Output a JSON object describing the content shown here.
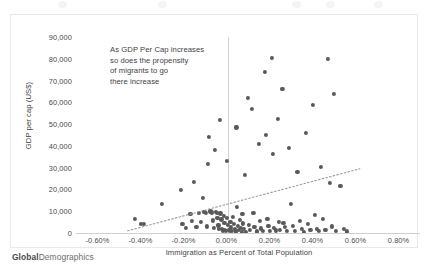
{
  "brand": {
    "bold": "Global",
    "rest": "Demographics"
  },
  "annotation": {
    "line1": "As GDP Per Cap increases",
    "line2": "so does the propensity",
    "line3": "of migrants to go",
    "line4": "there increase"
  },
  "chart_data": {
    "type": "scatter",
    "title": "",
    "xlabel": "Immigration as Percent of Total Population",
    "ylabel": "GDP per cap (US$)",
    "xlim": [
      -0.7,
      0.9
    ],
    "ylim": [
      0,
      90000
    ],
    "xticks": [
      -0.6,
      -0.4,
      -0.2,
      0.0,
      0.2,
      0.4,
      0.6,
      0.8
    ],
    "xtick_labels": [
      "-0.60%",
      "-0.40%",
      "-0.20%",
      "0.00%",
      "0.20%",
      "0.40%",
      "0.60%",
      "0.80%"
    ],
    "yticks": [
      0,
      10000,
      20000,
      30000,
      40000,
      50000,
      60000,
      70000,
      80000,
      90000
    ],
    "ytick_labels": [
      "0",
      "10,000",
      "20,000",
      "30,000",
      "40,000",
      "50,000",
      "60,000",
      "70,000",
      "80,000",
      "90,000"
    ],
    "grid": false,
    "legend": false,
    "marker_color": "#595959",
    "trendline": {
      "type": "linear-dotted",
      "color": "#9a9a9a",
      "x_start": -0.46,
      "y_start": 1000,
      "x_end": 0.62,
      "y_end": 29500
    },
    "points": [
      [
        -0.425,
        6600
      ],
      [
        -0.4,
        4300
      ],
      [
        -0.383,
        4100
      ],
      [
        -0.3,
        13200
      ],
      [
        -0.213,
        19800
      ],
      [
        -0.205,
        4200
      ],
      [
        -0.19,
        2300
      ],
      [
        -0.168,
        8900
      ],
      [
        -0.16,
        5500
      ],
      [
        -0.15,
        23500
      ],
      [
        -0.14,
        2800
      ],
      [
        -0.128,
        9200
      ],
      [
        -0.12,
        5100
      ],
      [
        -0.11,
        16300
      ],
      [
        -0.105,
        9800
      ],
      [
        -0.1,
        9600
      ],
      [
        -0.095,
        9400
      ],
      [
        -0.09,
        3000
      ],
      [
        -0.085,
        31800
      ],
      [
        -0.08,
        44000
      ],
      [
        -0.075,
        9900
      ],
      [
        -0.07,
        9500
      ],
      [
        -0.066,
        9300
      ],
      [
        -0.062,
        5800
      ],
      [
        -0.058,
        2500
      ],
      [
        -0.054,
        38000
      ],
      [
        -0.05,
        9700
      ],
      [
        -0.046,
        9100
      ],
      [
        -0.042,
        7000
      ],
      [
        -0.038,
        3500
      ],
      [
        -0.034,
        1800
      ],
      [
        -0.03,
        52000
      ],
      [
        -0.028,
        9000
      ],
      [
        -0.024,
        6200
      ],
      [
        -0.02,
        2000
      ],
      [
        -0.016,
        1200
      ],
      [
        -0.012,
        8000
      ],
      [
        -0.01,
        4600
      ],
      [
        -0.008,
        1500
      ],
      [
        -0.004,
        800
      ],
      [
        0.0,
        33000
      ],
      [
        0.002,
        6800
      ],
      [
        0.006,
        3600
      ],
      [
        0.01,
        1600
      ],
      [
        0.014,
        900
      ],
      [
        0.018,
        5200
      ],
      [
        0.022,
        2600
      ],
      [
        0.026,
        1100
      ],
      [
        0.03,
        7400
      ],
      [
        0.034,
        4000
      ],
      [
        0.038,
        1900
      ],
      [
        0.042,
        700
      ],
      [
        0.046,
        48500
      ],
      [
        0.05,
        12000
      ],
      [
        0.054,
        3200
      ],
      [
        0.058,
        1400
      ],
      [
        0.062,
        6000
      ],
      [
        0.066,
        2200
      ],
      [
        0.07,
        600
      ],
      [
        0.074,
        8600
      ],
      [
        0.078,
        4400
      ],
      [
        0.082,
        1700
      ],
      [
        0.086,
        26500
      ],
      [
        0.09,
        500
      ],
      [
        0.1,
        62000
      ],
      [
        0.105,
        3800
      ],
      [
        0.11,
        1300
      ],
      [
        0.12,
        57000
      ],
      [
        0.125,
        9400
      ],
      [
        0.13,
        2900
      ],
      [
        0.14,
        700
      ],
      [
        0.15,
        41000
      ],
      [
        0.155,
        5400
      ],
      [
        0.16,
        2100
      ],
      [
        0.17,
        1000
      ],
      [
        0.18,
        74000
      ],
      [
        0.185,
        45000
      ],
      [
        0.19,
        6400
      ],
      [
        0.195,
        3100
      ],
      [
        0.2,
        900
      ],
      [
        0.21,
        80500
      ],
      [
        0.215,
        36500
      ],
      [
        0.22,
        2400
      ],
      [
        0.23,
        1200
      ],
      [
        0.24,
        52500
      ],
      [
        0.245,
        5000
      ],
      [
        0.25,
        1600
      ],
      [
        0.26,
        66000
      ],
      [
        0.265,
        4800
      ],
      [
        0.27,
        2700
      ],
      [
        0.28,
        800
      ],
      [
        0.29,
        39000
      ],
      [
        0.3,
        13500
      ],
      [
        0.31,
        3400
      ],
      [
        0.32,
        1000
      ],
      [
        0.33,
        28000
      ],
      [
        0.34,
        5600
      ],
      [
        0.35,
        1800
      ],
      [
        0.36,
        600
      ],
      [
        0.37,
        46000
      ],
      [
        0.38,
        4200
      ],
      [
        0.39,
        1500
      ],
      [
        0.4,
        59000
      ],
      [
        0.41,
        8200
      ],
      [
        0.42,
        2000
      ],
      [
        0.43,
        900
      ],
      [
        0.44,
        30500
      ],
      [
        0.45,
        6600
      ],
      [
        0.46,
        1300
      ],
      [
        0.47,
        80000
      ],
      [
        0.48,
        23000
      ],
      [
        0.49,
        3000
      ],
      [
        0.5,
        64000
      ],
      [
        0.51,
        1100
      ],
      [
        0.53,
        21500
      ],
      [
        0.545,
        1900
      ],
      [
        0.56,
        700
      ]
    ]
  }
}
